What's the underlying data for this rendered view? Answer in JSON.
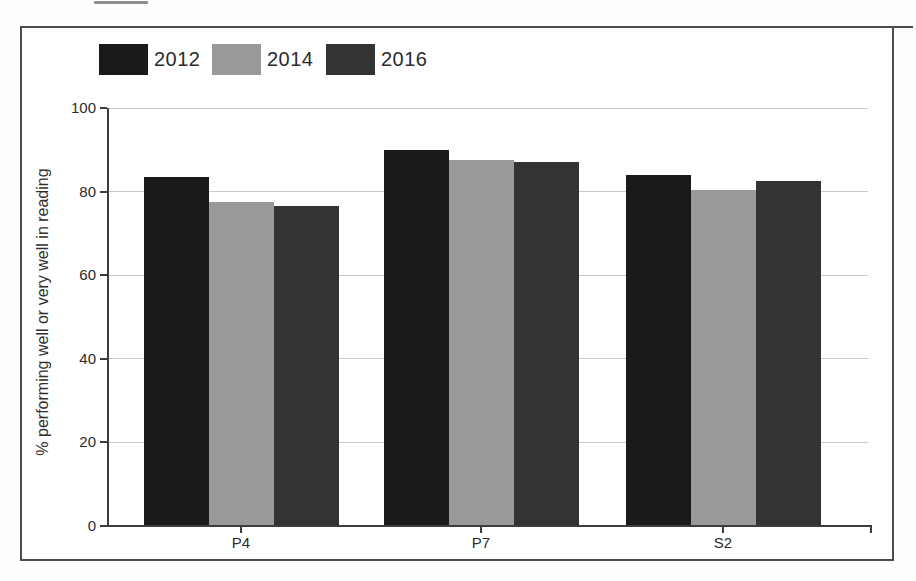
{
  "chart_data": {
    "type": "bar",
    "title": "",
    "categories": [
      "P4",
      "P7",
      "S2"
    ],
    "series": [
      {
        "name": "2012",
        "color": "#1a1a1a",
        "values": [
          83.5,
          90,
          84
        ]
      },
      {
        "name": "2014",
        "color": "#999999",
        "values": [
          77.5,
          87.5,
          80.5
        ]
      },
      {
        "name": "2016",
        "color": "#333333",
        "values": [
          76.5,
          87,
          82.5
        ]
      }
    ],
    "xlabel": "",
    "ylabel": "% performing well or very well in reading",
    "ylim": [
      0,
      100
    ],
    "yticks": [
      0,
      20,
      40,
      60,
      80,
      100
    ],
    "grid": true,
    "legend_position": "top-left",
    "colors": {
      "text": "#2b2b2b",
      "axis": "#3d3d3d",
      "gridline": "#c9c9c9",
      "frame_border": "#4d4d4d",
      "background": "#ffffff"
    }
  }
}
